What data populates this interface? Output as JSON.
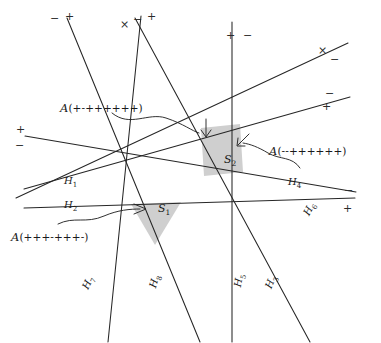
{
  "figure": {
    "type": "hyperplane-arrangement",
    "background": "#ffffff",
    "line_color": "#262626",
    "shade_color": "#cfcfcf",
    "width": 381,
    "height": 343
  },
  "regions": [
    {
      "id": "S1",
      "label": "S",
      "subscript": "1",
      "x": 158,
      "y": 209
    },
    {
      "id": "S2",
      "label": "S",
      "subscript": "2",
      "x": 224,
      "y": 160
    }
  ],
  "hyperplane_labels": [
    {
      "name": "H",
      "subscript": "1",
      "x": 64,
      "y": 182,
      "rotate": 0
    },
    {
      "name": "H",
      "subscript": "2",
      "x": 64,
      "y": 206,
      "rotate": 0
    },
    {
      "name": "H",
      "subscript": "4",
      "x": 288,
      "y": 183,
      "rotate": 0
    },
    {
      "name": "H",
      "subscript": "6",
      "x": 299,
      "y": 214,
      "rotate": -62
    },
    {
      "name": "H",
      "subscript": "7",
      "x": 79,
      "y": 288,
      "rotate": -64
    },
    {
      "name": "H",
      "subscript": "8",
      "x": 146,
      "y": 288,
      "rotate": -74
    },
    {
      "name": "H",
      "subscript": "5",
      "x": 231,
      "y": 288,
      "rotate": -80
    },
    {
      "name": "H",
      "subscript": "3",
      "x": 262,
      "y": 288,
      "rotate": -68
    }
  ],
  "covector_labels": [
    {
      "id": "A-top-left",
      "prefix": "A",
      "signs": "(+-++++++)",
      "x": 60,
      "y": 101
    },
    {
      "id": "A-right",
      "prefix": "A",
      "signs": "(--++++++)",
      "x": 269,
      "y": 144
    },
    {
      "id": "A-bottom-left",
      "prefix": "A",
      "signs": "(+++-+++-)",
      "x": 11,
      "y": 230
    }
  ],
  "sign_markers": [
    {
      "id": "m1",
      "text": "+",
      "x": 65,
      "y": 11
    },
    {
      "id": "m2",
      "text": "−",
      "x": 50,
      "y": 13
    },
    {
      "id": "m3",
      "text": "×",
      "x": 120,
      "y": 19
    },
    {
      "id": "m4",
      "text": "−",
      "x": 133,
      "y": 14
    },
    {
      "id": "m5",
      "text": "+",
      "x": 147,
      "y": 11
    },
    {
      "id": "m6",
      "text": "+",
      "x": 226,
      "y": 30
    },
    {
      "id": "m7",
      "text": "−",
      "x": 243,
      "y": 30
    },
    {
      "id": "m8",
      "text": "×",
      "x": 318,
      "y": 45
    },
    {
      "id": "m9",
      "text": "−",
      "x": 330,
      "y": 54
    },
    {
      "id": "m10",
      "text": "−",
      "x": 325,
      "y": 88
    },
    {
      "id": "m11",
      "text": "+",
      "x": 322,
      "y": 101
    },
    {
      "id": "m12",
      "text": "+",
      "x": 16,
      "y": 124
    },
    {
      "id": "m13",
      "text": "−",
      "x": 15,
      "y": 140
    },
    {
      "id": "m14",
      "text": "−",
      "x": 344,
      "y": 185
    },
    {
      "id": "m15",
      "text": "+",
      "x": 343,
      "y": 203
    }
  ],
  "lines": [
    {
      "id": "L1",
      "x1": 25,
      "y1": 136,
      "x2": 356,
      "y2": 192
    },
    {
      "id": "L2",
      "x1": 24,
      "y1": 208,
      "x2": 355,
      "y2": 198
    },
    {
      "id": "L3",
      "x1": 67,
      "y1": 18,
      "x2": 200,
      "y2": 342
    },
    {
      "id": "L4",
      "x1": 141,
      "y1": 16,
      "x2": 108,
      "y2": 342
    },
    {
      "id": "L5",
      "x1": 135,
      "y1": 18,
      "x2": 310,
      "y2": 342
    },
    {
      "id": "L6",
      "x1": 232,
      "y1": 22,
      "x2": 232,
      "y2": 342
    },
    {
      "id": "L7",
      "x1": 16,
      "y1": 198,
      "x2": 348,
      "y2": 43
    },
    {
      "id": "L8",
      "x1": 24,
      "y1": 189,
      "x2": 350,
      "y2": 97
    }
  ]
}
